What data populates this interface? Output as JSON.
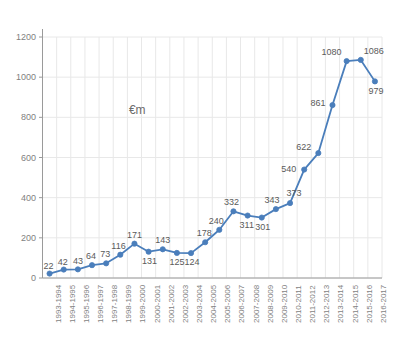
{
  "chart_title": "",
  "unit_annotation": "€m",
  "axis": {
    "y_ticks": [
      "0",
      "200",
      "400",
      "600",
      "800",
      "1000",
      "1200"
    ],
    "x_ticks": [
      "1993-1994",
      "1994-1995",
      "1995-1996",
      "1996-1997",
      "1997-1998",
      "1998-1999",
      "1999-2000",
      "2000-2001",
      "2001-2002",
      "2002-2003",
      "2003-2004",
      "2004-2005",
      "2005-2006",
      "2006-2007",
      "2007-2008",
      "2008-2009",
      "2009-2010",
      "2010-2011",
      "2011-2012",
      "2012-2013",
      "2013-2014",
      "2014-2015",
      "2015-2016",
      "2016-2017"
    ]
  },
  "colors": {
    "series_line": "#4A7EBB",
    "marker": "#4A7EBB",
    "gridline": "#E8E8E8",
    "axis": "#9a9a9a",
    "tick_text": "#7f7f7f",
    "label_text": "#5a5a5a"
  },
  "data_labels": [
    "22",
    "42",
    "43",
    "64",
    "73",
    "116",
    "171",
    "131",
    "143",
    "125",
    "124",
    "178",
    "240",
    "332",
    "311",
    "301",
    "343",
    "373",
    "540",
    "622",
    "861",
    "1080",
    "1086",
    "979"
  ],
  "chart_data": {
    "type": "line",
    "title": "",
    "xlabel": "",
    "ylabel": "",
    "unit": "€m",
    "ylim": [
      0,
      1200
    ],
    "ytick_step": 200,
    "grid": true,
    "legend": false,
    "markers": true,
    "categories": [
      "1993-1994",
      "1994-1995",
      "1995-1996",
      "1996-1997",
      "1997-1998",
      "1998-1999",
      "1999-2000",
      "2000-2001",
      "2001-2002",
      "2002-2003",
      "2003-2004",
      "2004-2005",
      "2005-2006",
      "2006-2007",
      "2007-2008",
      "2008-2009",
      "2009-2010",
      "2010-2011",
      "2011-2012",
      "2012-2013",
      "2013-2014",
      "2014-2015",
      "2015-2016",
      "2016-2017"
    ],
    "values": [
      22,
      42,
      43,
      64,
      73,
      116,
      171,
      131,
      143,
      125,
      124,
      178,
      240,
      332,
      311,
      301,
      343,
      373,
      540,
      622,
      861,
      1080,
      1086,
      979
    ],
    "annotations": [
      {
        "text": "€m",
        "x": "1999-2000",
        "y": 830
      }
    ]
  }
}
